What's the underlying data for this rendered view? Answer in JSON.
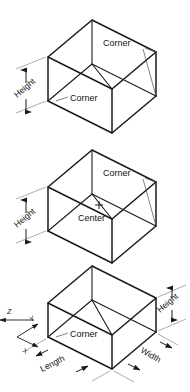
{
  "figure": {
    "line_color": "#1a1a1a",
    "dim_color": "#8a8a8a",
    "background": "#ffffff"
  },
  "panels": [
    {
      "id": "panel-corner",
      "labels": {
        "corner_top": "Corner",
        "corner_bottom": "Corner",
        "height": "Height"
      }
    },
    {
      "id": "panel-center",
      "labels": {
        "corner_top": "Corner",
        "center": "Center",
        "height": "Height"
      }
    },
    {
      "id": "panel-dimensions",
      "labels": {
        "corner": "Corner",
        "height": "Height",
        "width": "Width",
        "length": "Length"
      },
      "axes": {
        "x": "X",
        "y": "Y",
        "z": "Z"
      }
    }
  ]
}
